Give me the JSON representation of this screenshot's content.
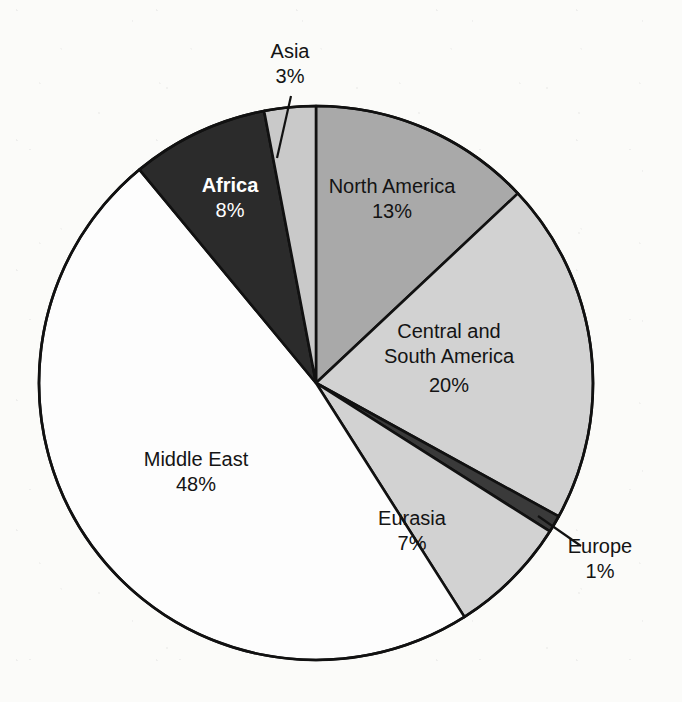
{
  "chart_data": {
    "type": "pie",
    "title": "",
    "subtitle": "",
    "xlabel": "",
    "ylabel": "",
    "legend": "none",
    "grid": false,
    "units": "percent",
    "start_angle_deg": 0,
    "direction": "clockwise",
    "categories": [
      "North America",
      "Central and South America",
      "Europe",
      "Eurasia",
      "Middle East",
      "Africa",
      "Asia"
    ],
    "values": [
      13,
      20,
      1,
      7,
      48,
      8,
      3
    ],
    "slices": [
      {
        "name": "North America",
        "label_line1": "North America",
        "label_line2": "",
        "value_label": "13%",
        "value": 13,
        "fill": "#a9a9a9",
        "text_color": "#141414",
        "bold": false,
        "callout": false,
        "label_x": 392,
        "label_y": 193,
        "value_x": 392,
        "value_y": 218
      },
      {
        "name": "Central and South America",
        "label_line1": "Central and",
        "label_line2": "South America",
        "value_label": "20%",
        "value": 20,
        "fill": "#d2d2d2",
        "text_color": "#141414",
        "bold": false,
        "callout": false,
        "label_x": 449,
        "label_y": 338,
        "value_x": 449,
        "value_y": 392
      },
      {
        "name": "Europe",
        "label_line1": "Europe",
        "label_line2": "",
        "value_label": "1%",
        "value": 1,
        "fill": "#3a3a3a",
        "text_color": "#141414",
        "bold": false,
        "callout": true,
        "label_x": 600,
        "label_y": 553,
        "value_x": 600,
        "value_y": 578
      },
      {
        "name": "Eurasia",
        "label_line1": "Eurasia",
        "label_line2": "",
        "value_label": "7%",
        "value": 7,
        "fill": "#d2d2d2",
        "text_color": "#141414",
        "bold": false,
        "callout": false,
        "label_x": 412,
        "label_y": 525,
        "value_x": 412,
        "value_y": 550
      },
      {
        "name": "Middle East",
        "label_line1": "Middle East",
        "label_line2": "",
        "value_label": "48%",
        "value": 48,
        "fill": "#fdfdfd",
        "text_color": "#141414",
        "bold": false,
        "callout": false,
        "label_x": 196,
        "label_y": 466,
        "value_x": 196,
        "value_y": 491
      },
      {
        "name": "Africa",
        "label_line1": "Africa",
        "label_line2": "",
        "value_label": "8%",
        "value": 8,
        "fill": "#2b2b2b",
        "text_color": "#ffffff",
        "bold": true,
        "callout": false,
        "label_x": 230,
        "label_y": 192,
        "value_x": 230,
        "value_y": 217
      },
      {
        "name": "Asia",
        "label_line1": "Asia",
        "label_line2": "",
        "value_label": "3%",
        "value": 3,
        "fill": "#c9c9c9",
        "text_color": "#141414",
        "bold": false,
        "callout": true,
        "label_x": 290,
        "label_y": 58,
        "value_x": 290,
        "value_y": 83
      }
    ],
    "geometry": {
      "center_x": 316,
      "center_y": 383,
      "radius": 277,
      "outline_color": "#111111",
      "outline_width": 2.6
    },
    "callouts": [
      {
        "name": "asia-callout",
        "x1": 291,
        "y1": 96,
        "x2": 277,
        "y2": 158
      },
      {
        "name": "europe-callout",
        "x1": 581,
        "y1": 546,
        "x2": 538,
        "y2": 516
      }
    ]
  },
  "background": {
    "paper_color": "#fbfbf9",
    "ink_color": "#111111"
  }
}
